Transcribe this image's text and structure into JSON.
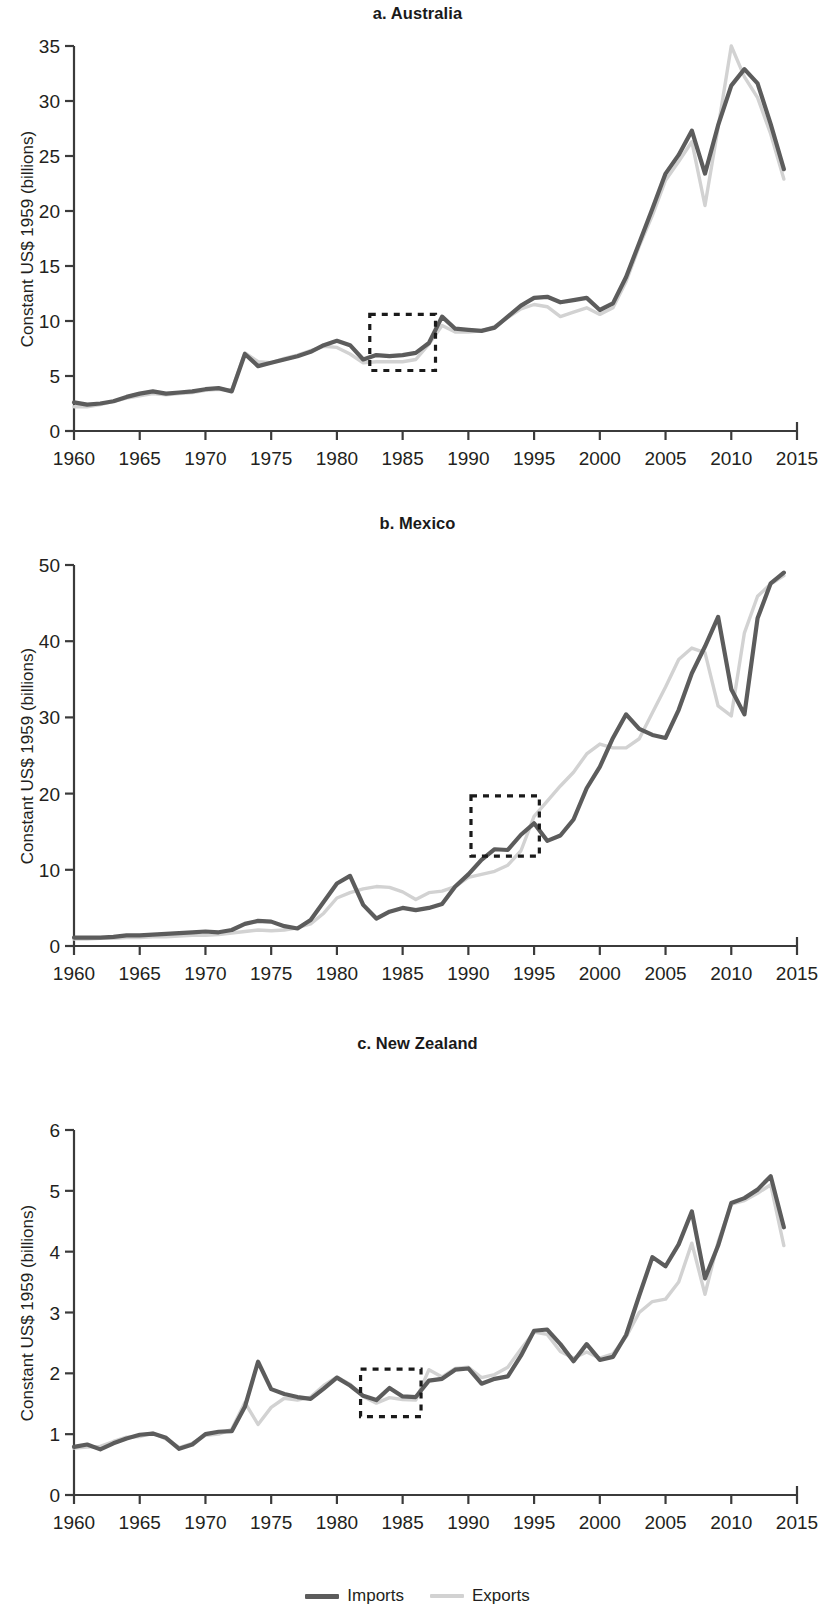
{
  "figure": {
    "ylabel": "Constant US$ 1959 (billions)",
    "legend": [
      {
        "key": "imports",
        "label": "Imports",
        "color": "#5c5c5c"
      },
      {
        "key": "exports",
        "label": "Exports",
        "color": "#d2d2d2"
      }
    ]
  },
  "chart_data": [
    {
      "type": "line",
      "title": "a. Australia",
      "xlabel": "",
      "ylabel": "Constant US$ 1959 (billions)",
      "xlim": [
        1960,
        2015
      ],
      "ylim": [
        0,
        35
      ],
      "yticks": [
        0,
        5,
        10,
        15,
        20,
        25,
        30,
        35
      ],
      "xticks": [
        1960,
        1965,
        1970,
        1975,
        1980,
        1985,
        1990,
        1995,
        2000,
        2005,
        2010,
        2015
      ],
      "grid": false,
      "legend_position": "bottom",
      "annotation_box": {
        "x0": 1982.5,
        "x1": 1987.5,
        "y0": 5.5,
        "y1": 10.6,
        "style": "dashed"
      },
      "x": [
        1960,
        1961,
        1962,
        1963,
        1964,
        1965,
        1966,
        1967,
        1968,
        1969,
        1970,
        1971,
        1972,
        1973,
        1974,
        1975,
        1976,
        1977,
        1978,
        1979,
        1980,
        1981,
        1982,
        1983,
        1984,
        1985,
        1986,
        1987,
        1988,
        1989,
        1990,
        1991,
        1992,
        1993,
        1994,
        1995,
        1996,
        1997,
        1998,
        1999,
        2000,
        2001,
        2002,
        2003,
        2004,
        2005,
        2006,
        2007,
        2008,
        2009,
        2010,
        2011,
        2012,
        2013,
        2014
      ],
      "series": [
        {
          "name": "Imports",
          "color": "#5c5c5c",
          "values": [
            2.6,
            2.4,
            2.5,
            2.7,
            3.1,
            3.4,
            3.6,
            3.4,
            3.5,
            3.6,
            3.8,
            3.9,
            3.6,
            7.0,
            5.9,
            6.2,
            6.5,
            6.8,
            7.2,
            7.8,
            8.2,
            7.8,
            6.5,
            6.9,
            6.8,
            6.9,
            7.1,
            8.0,
            10.4,
            9.3,
            9.2,
            9.1,
            9.4,
            10.4,
            11.4,
            12.1,
            12.2,
            11.7,
            11.9,
            12.1,
            11.0,
            11.6,
            14.0,
            17.1,
            20.2,
            23.4,
            25.1,
            27.3,
            23.4,
            27.8,
            31.4,
            32.9,
            31.6,
            27.9,
            23.8
          ]
        },
        {
          "name": "Exports",
          "color": "#d2d2d2",
          "values": [
            2.2,
            2.2,
            2.4,
            2.7,
            3.0,
            3.2,
            3.4,
            3.3,
            3.4,
            3.5,
            3.7,
            3.8,
            3.7,
            7.1,
            6.3,
            6.2,
            6.6,
            6.9,
            7.3,
            7.7,
            7.6,
            7.0,
            6.2,
            6.3,
            6.3,
            6.3,
            6.5,
            7.9,
            9.6,
            9.0,
            9.0,
            9.1,
            9.5,
            10.3,
            11.1,
            11.5,
            11.3,
            10.4,
            10.8,
            11.2,
            10.6,
            11.2,
            13.6,
            16.8,
            19.6,
            22.8,
            24.5,
            26.3,
            20.5,
            27.6,
            35.0,
            32.2,
            30.3,
            27.0,
            22.9
          ]
        }
      ]
    },
    {
      "type": "line",
      "title": "b. Mexico",
      "xlabel": "",
      "ylabel": "Constant US$ 1959 (billions)",
      "xlim": [
        1960,
        2015
      ],
      "ylim": [
        0,
        50
      ],
      "yticks": [
        0,
        10,
        20,
        30,
        40,
        50
      ],
      "xticks": [
        1960,
        1965,
        1970,
        1975,
        1980,
        1985,
        1990,
        1995,
        2000,
        2005,
        2010,
        2015
      ],
      "grid": false,
      "legend_position": "bottom",
      "annotation_box": {
        "x0": 1990.2,
        "x1": 1995.4,
        "y0": 11.8,
        "y1": 19.7,
        "style": "dashed"
      },
      "x": [
        1960,
        1961,
        1962,
        1963,
        1964,
        1965,
        1966,
        1967,
        1968,
        1969,
        1970,
        1971,
        1972,
        1973,
        1974,
        1975,
        1976,
        1977,
        1978,
        1979,
        1980,
        1981,
        1982,
        1983,
        1984,
        1985,
        1986,
        1987,
        1988,
        1989,
        1990,
        1991,
        1992,
        1993,
        1994,
        1995,
        1996,
        1997,
        1998,
        1999,
        2000,
        2001,
        2002,
        2003,
        2004,
        2005,
        2006,
        2007,
        2008,
        2009,
        2010,
        2011,
        2012,
        2013,
        2014
      ],
      "series": [
        {
          "name": "Imports",
          "color": "#5c5c5c",
          "values": [
            1.1,
            1.1,
            1.1,
            1.2,
            1.4,
            1.4,
            1.5,
            1.6,
            1.7,
            1.8,
            1.9,
            1.8,
            2.1,
            2.9,
            3.3,
            3.2,
            2.6,
            2.3,
            3.4,
            5.8,
            8.2,
            9.2,
            5.4,
            3.6,
            4.5,
            5.0,
            4.7,
            5.0,
            5.5,
            7.8,
            9.4,
            11.3,
            12.7,
            12.6,
            14.6,
            16.1,
            13.8,
            14.5,
            16.6,
            20.7,
            23.5,
            27.3,
            30.4,
            28.5,
            27.7,
            27.3,
            31.0,
            35.8,
            39.3,
            43.2,
            33.7,
            30.4,
            43.0,
            47.6,
            49.0
          ]
        },
        {
          "name": "Exports",
          "color": "#d2d2d2",
          "values": [
            0.9,
            0.9,
            1.0,
            1.0,
            1.1,
            1.1,
            1.2,
            1.2,
            1.3,
            1.4,
            1.4,
            1.5,
            1.7,
            1.9,
            2.1,
            2.0,
            2.1,
            2.4,
            2.9,
            4.3,
            6.3,
            7.0,
            7.5,
            7.8,
            7.7,
            7.1,
            6.1,
            7.0,
            7.2,
            7.8,
            9.0,
            9.4,
            9.8,
            10.6,
            12.5,
            17.0,
            19.0,
            21.0,
            22.8,
            25.2,
            26.5,
            26.0,
            26.0,
            27.2,
            30.6,
            34.0,
            37.6,
            39.1,
            38.5,
            31.5,
            30.2,
            41.1,
            45.9,
            47.5,
            48.6
          ]
        }
      ]
    },
    {
      "type": "line",
      "title": "c. New Zealand",
      "xlabel": "",
      "ylabel": "Constant US$ 1959 (billions)",
      "xlim": [
        1960,
        2015
      ],
      "ylim": [
        0,
        6
      ],
      "yticks": [
        0,
        1,
        2,
        3,
        4,
        5,
        6
      ],
      "xticks": [
        1960,
        1965,
        1970,
        1975,
        1980,
        1985,
        1990,
        1995,
        2000,
        2005,
        2010,
        2015
      ],
      "grid": false,
      "legend_position": "bottom",
      "annotation_box": {
        "x0": 1981.8,
        "x1": 1986.4,
        "y0": 1.29,
        "y1": 2.07,
        "style": "dashed"
      },
      "x": [
        1960,
        1961,
        1962,
        1963,
        1964,
        1965,
        1966,
        1967,
        1968,
        1969,
        1970,
        1971,
        1972,
        1973,
        1974,
        1975,
        1976,
        1977,
        1978,
        1979,
        1980,
        1981,
        1982,
        1983,
        1984,
        1985,
        1986,
        1987,
        1988,
        1989,
        1990,
        1991,
        1992,
        1993,
        1994,
        1995,
        1996,
        1997,
        1998,
        1999,
        2000,
        2001,
        2002,
        2003,
        2004,
        2005,
        2006,
        2007,
        2008,
        2009,
        2010,
        2011,
        2012,
        2013,
        2014
      ],
      "series": [
        {
          "name": "Imports",
          "color": "#5c5c5c",
          "values": [
            0.79,
            0.83,
            0.75,
            0.85,
            0.93,
            0.99,
            1.01,
            0.94,
            0.76,
            0.83,
            1.0,
            1.04,
            1.05,
            1.45,
            2.19,
            1.74,
            1.66,
            1.61,
            1.58,
            1.75,
            1.93,
            1.8,
            1.63,
            1.56,
            1.76,
            1.62,
            1.61,
            1.88,
            1.91,
            2.06,
            2.08,
            1.83,
            1.91,
            1.95,
            2.29,
            2.7,
            2.72,
            2.48,
            2.2,
            2.48,
            2.22,
            2.27,
            2.63,
            3.28,
            3.91,
            3.76,
            4.12,
            4.66,
            3.56,
            4.1,
            4.8,
            4.88,
            5.02,
            5.24,
            4.4
          ]
        },
        {
          "name": "Exports",
          "color": "#d2d2d2",
          "values": [
            0.77,
            0.79,
            0.8,
            0.88,
            0.95,
            0.96,
            1.02,
            0.92,
            0.78,
            0.85,
            0.98,
            1.0,
            1.08,
            1.52,
            1.16,
            1.44,
            1.59,
            1.56,
            1.61,
            1.8,
            1.94,
            1.82,
            1.62,
            1.51,
            1.6,
            1.57,
            1.56,
            2.06,
            1.94,
            2.08,
            2.1,
            1.93,
            1.98,
            2.1,
            2.4,
            2.68,
            2.64,
            2.36,
            2.25,
            2.35,
            2.25,
            2.32,
            2.6,
            3.0,
            3.18,
            3.22,
            3.5,
            4.14,
            3.3,
            4.16,
            4.78,
            4.84,
            4.96,
            5.1,
            4.1
          ]
        }
      ]
    }
  ]
}
